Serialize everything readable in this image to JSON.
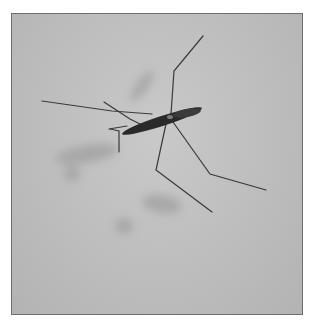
{
  "image": {
    "subject": "water strider on water surface",
    "style": "grayscale photograph",
    "frame_color": "#6e6e6e",
    "background_color": "#bfbfbf",
    "insect_color": "#2a2a2a",
    "shadow_color": "#9a9a9a"
  }
}
